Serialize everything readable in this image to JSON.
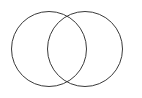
{
  "canvas": {
    "width": 142,
    "height": 98,
    "background_color": "#ffffff"
  },
  "diagram": {
    "type": "venn-diagram",
    "set_count": 2,
    "fill": "none",
    "stroke_color": "#3a3a3a",
    "stroke_width": 1,
    "labels_present": false,
    "title": "",
    "circles": [
      {
        "name": "left-set",
        "cx": 49,
        "cy": 49,
        "r": 37.5,
        "label": ""
      },
      {
        "name": "right-set",
        "cx": 85,
        "cy": 49,
        "r": 37.5,
        "label": ""
      }
    ],
    "intersection_points": [
      {
        "x": 67,
        "y": 14
      },
      {
        "x": 67,
        "y": 84
      }
    ],
    "regions": [
      {
        "name": "left-only",
        "label": "",
        "fill": "#ffffff"
      },
      {
        "name": "intersection",
        "label": "",
        "fill": "#ffffff"
      },
      {
        "name": "right-only",
        "label": "",
        "fill": "#ffffff"
      }
    ]
  }
}
